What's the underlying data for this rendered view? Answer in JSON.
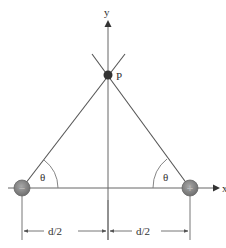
{
  "diagram": {
    "axes": {
      "x_label": "x",
      "y_label": "y"
    },
    "point": {
      "label": "P"
    },
    "charges": [
      {
        "name": "negative-charge",
        "sign": "−",
        "position": "left"
      },
      {
        "name": "positive-charge",
        "sign": "+",
        "position": "right"
      }
    ],
    "angles": [
      {
        "label": "θ",
        "at": "negative-charge"
      },
      {
        "label": "θ",
        "at": "positive-charge"
      }
    ],
    "dimensions": [
      {
        "label": "d/2",
        "span": "left"
      },
      {
        "label": "d/2",
        "span": "right"
      }
    ],
    "colors": {
      "line": "#555555",
      "charge_fill": "#8a8a8a",
      "point_fill": "#333333",
      "text": "#333333"
    }
  }
}
